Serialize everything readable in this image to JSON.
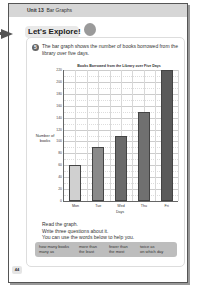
{
  "header": {
    "unit": "Unit 13",
    "topic": "Bar Graphs"
  },
  "section": {
    "title": "Let's Explore!",
    "icon": "ribbon-badge-icon"
  },
  "question": {
    "number": "5",
    "intro": "The bar graph shows the number of books borrowed from the library over five days."
  },
  "chart_data": {
    "type": "bar",
    "title": "Books Borrowed from the Library over Five Days",
    "categories": [
      "Mon",
      "Tue",
      "Wed",
      "Thu",
      "Fri"
    ],
    "values": [
      60,
      90,
      110,
      150,
      220
    ],
    "xlabel": "Days",
    "ylabel": "Number of books",
    "ylim": [
      0,
      220
    ],
    "yticks": [
      0,
      20,
      40,
      60,
      80,
      100,
      120,
      140,
      160,
      180,
      200,
      220
    ],
    "grid": true,
    "bar_colors": [
      "#d0d0d0",
      "#8a8a8a",
      "#6a6a6a",
      "#707070",
      "#5a5a5a"
    ]
  },
  "instructions": {
    "line1": "Read the graph.",
    "line2": "Write three questions about it.",
    "line3": "You can use the words below to help you."
  },
  "word_bank": [
    "how many books\nmany as",
    "more than\nthe least",
    "fewer than\nthe most",
    "twice as\non which day"
  ],
  "page_number": "44"
}
